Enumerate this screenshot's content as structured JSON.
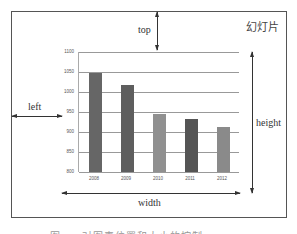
{
  "slide": {
    "label": "幻灯片"
  },
  "annotations": {
    "top": "top",
    "left": "left",
    "width": "width",
    "height": "height"
  },
  "caption": "图 ... 对图表位置和大小的控制",
  "colors": {
    "frame": "#555555",
    "grid": "#999999",
    "arrow": "#333333",
    "bars": [
      "#666666",
      "#5e5e5e",
      "#909090",
      "#555555",
      "#8a8a8a"
    ]
  },
  "chart_data": {
    "type": "bar",
    "title": "",
    "xlabel": "",
    "ylabel": "",
    "categories": [
      "2008",
      "2009",
      "2010",
      "2011",
      "2012"
    ],
    "values": [
      1048,
      1018,
      945,
      932,
      913
    ],
    "ylim": [
      800,
      1100
    ],
    "yticks": [
      "1100",
      "1050",
      "1000",
      "950",
      "900",
      "850",
      "800"
    ],
    "grid": true,
    "legend": "none"
  }
}
